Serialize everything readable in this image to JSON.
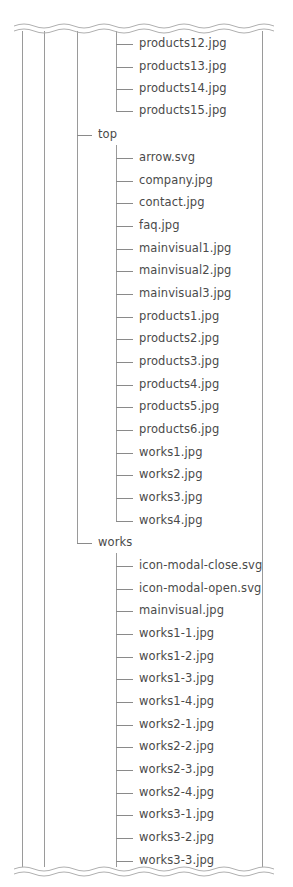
{
  "diagram": {
    "type": "directory-tree",
    "colors": {
      "line": "#9a9a9a",
      "text": "#4a4a4a",
      "background": "#ffffff",
      "wave": "#b0b0b0"
    },
    "layout": {
      "row_height": 22.4,
      "outer_lines_x": [
        22,
        44,
        77
      ],
      "right_line_x": 262,
      "folder_branch_x": 77,
      "file_branch_x": 116,
      "folder_label_x": 98,
      "file_label_x": 139
    },
    "nodes": [
      {
        "id": "f0",
        "label": "products12.jpg",
        "level": "file",
        "y": 44
      },
      {
        "id": "f1",
        "label": "products13.jpg",
        "level": "file",
        "y": 67
      },
      {
        "id": "f2",
        "label": "products14.jpg",
        "level": "file",
        "y": 89
      },
      {
        "id": "f3",
        "label": "products15.jpg",
        "level": "file",
        "y": 111,
        "last": true
      },
      {
        "id": "d0",
        "label": "top",
        "level": "folder",
        "y": 135
      },
      {
        "id": "f4",
        "label": "arrow.svg",
        "level": "file",
        "y": 158
      },
      {
        "id": "f5",
        "label": "company.jpg",
        "level": "file",
        "y": 181
      },
      {
        "id": "f6",
        "label": "contact.jpg",
        "level": "file",
        "y": 203
      },
      {
        "id": "f7",
        "label": "faq.jpg",
        "level": "file",
        "y": 226
      },
      {
        "id": "f8",
        "label": "mainvisual1.jpg",
        "level": "file",
        "y": 249
      },
      {
        "id": "f9",
        "label": "mainvisual2.jpg",
        "level": "file",
        "y": 271
      },
      {
        "id": "f10",
        "label": "mainvisual3.jpg",
        "level": "file",
        "y": 294
      },
      {
        "id": "f11",
        "label": "products1.jpg",
        "level": "file",
        "y": 317
      },
      {
        "id": "f12",
        "label": "products2.jpg",
        "level": "file",
        "y": 339
      },
      {
        "id": "f13",
        "label": "products3.jpg",
        "level": "file",
        "y": 362
      },
      {
        "id": "f14",
        "label": "products4.jpg",
        "level": "file",
        "y": 385
      },
      {
        "id": "f15",
        "label": "products5.jpg",
        "level": "file",
        "y": 407
      },
      {
        "id": "f16",
        "label": "products6.jpg",
        "level": "file",
        "y": 430
      },
      {
        "id": "f17",
        "label": "works1.jpg",
        "level": "file",
        "y": 453
      },
      {
        "id": "f18",
        "label": "works2.jpg",
        "level": "file",
        "y": 475
      },
      {
        "id": "f19",
        "label": "works3.jpg",
        "level": "file",
        "y": 498
      },
      {
        "id": "f20",
        "label": "works4.jpg",
        "level": "file",
        "y": 521,
        "last": true
      },
      {
        "id": "d1",
        "label": "works",
        "level": "folder",
        "y": 543,
        "last": true
      },
      {
        "id": "f21",
        "label": "icon-modal-close.svg",
        "level": "file",
        "y": 566
      },
      {
        "id": "f22",
        "label": "icon-modal-open.svg",
        "level": "file",
        "y": 589
      },
      {
        "id": "f23",
        "label": "mainvisual.jpg",
        "level": "file",
        "y": 611
      },
      {
        "id": "f24",
        "label": "works1-1.jpg",
        "level": "file",
        "y": 634
      },
      {
        "id": "f25",
        "label": "works1-2.jpg",
        "level": "file",
        "y": 657
      },
      {
        "id": "f26",
        "label": "works1-3.jpg",
        "level": "file",
        "y": 679
      },
      {
        "id": "f27",
        "label": "works1-4.jpg",
        "level": "file",
        "y": 702
      },
      {
        "id": "f28",
        "label": "works2-1.jpg",
        "level": "file",
        "y": 725
      },
      {
        "id": "f29",
        "label": "works2-2.jpg",
        "level": "file",
        "y": 747
      },
      {
        "id": "f30",
        "label": "works2-3.jpg",
        "level": "file",
        "y": 770
      },
      {
        "id": "f31",
        "label": "works2-4.jpg",
        "level": "file",
        "y": 793
      },
      {
        "id": "f32",
        "label": "works3-1.jpg",
        "level": "file",
        "y": 815
      },
      {
        "id": "f33",
        "label": "works3-2.jpg",
        "level": "file",
        "y": 838
      },
      {
        "id": "f34",
        "label": "works3-3.jpg",
        "level": "file",
        "y": 861
      }
    ]
  }
}
